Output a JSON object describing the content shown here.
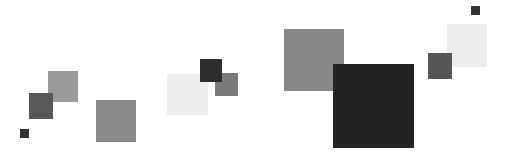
{
  "canvas": {
    "width": 508,
    "height": 165,
    "background": "#ffffff"
  },
  "squares": [
    {
      "x": 167,
      "y": 74,
      "w": 41,
      "h": 41,
      "color": "#ededed"
    },
    {
      "x": 447,
      "y": 24,
      "w": 40,
      "h": 43,
      "color": "#eeeeee"
    },
    {
      "x": 48,
      "y": 71,
      "w": 30,
      "h": 31,
      "color": "#9a9a9a"
    },
    {
      "x": 29,
      "y": 93,
      "w": 24,
      "h": 26,
      "color": "#575757"
    },
    {
      "x": 20,
      "y": 129,
      "w": 9,
      "h": 9,
      "color": "#333333"
    },
    {
      "x": 96,
      "y": 100,
      "w": 40,
      "h": 42,
      "color": "#8a8a8a"
    },
    {
      "x": 215,
      "y": 73,
      "w": 23,
      "h": 23,
      "color": "#7a7a7a"
    },
    {
      "x": 200,
      "y": 59,
      "w": 22,
      "h": 23,
      "color": "#2c2c2c"
    },
    {
      "x": 284,
      "y": 29,
      "w": 60,
      "h": 62,
      "color": "#888888"
    },
    {
      "x": 333,
      "y": 64,
      "w": 81,
      "h": 84,
      "color": "#242424"
    },
    {
      "x": 428,
      "y": 53,
      "w": 24,
      "h": 26,
      "color": "#565656"
    },
    {
      "x": 471,
      "y": 6,
      "w": 9,
      "h": 9,
      "color": "#333333"
    }
  ]
}
